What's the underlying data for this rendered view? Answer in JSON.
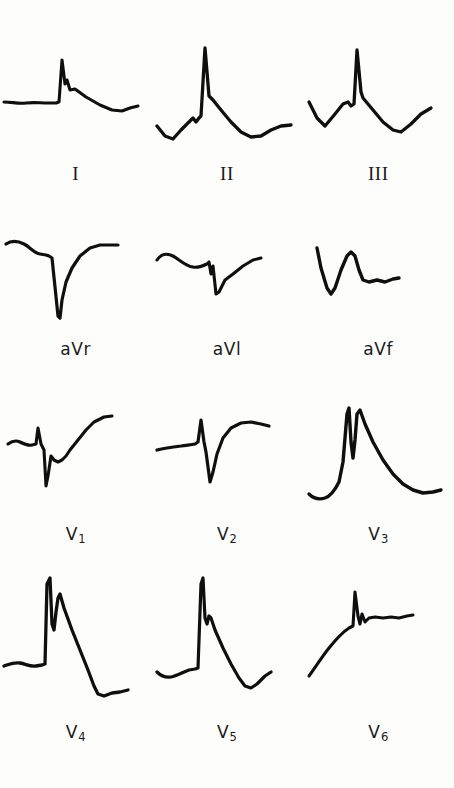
{
  "figure": {
    "kind": "12-lead-electrocardiogram",
    "background_color": "#fdfdfc",
    "trace_color": "#100f0f",
    "rows": 4,
    "columns": 3
  },
  "rows": [
    {
      "name": "limb-leads",
      "leads": [
        {
          "id": "I",
          "label": "I",
          "label_style": "roman",
          "morphology": "flat isoelectric baseline, small sharp R wave with notch on downstroke, low rounded T wave descending to end",
          "r_wave_height": "small",
          "s_wave_depth": "none",
          "t_wave": "low positive",
          "path": "M4,62 C12,62 18,64 26,63 C34,62 40,63 48,63 L56,63 L59,62 L62,20 L65,44 L67,40 L70,50 L75,49 L86,57 L100,65 L112,70 L122,71 L130,68 L138,66"
        },
        {
          "id": "II",
          "label": "II",
          "label_style": "roman",
          "morphology": "initial downward dip, small bump, very tall narrow R wave, rapid descent with shoulder, T wave trough then rise",
          "r_wave_height": "very tall",
          "s_wave_depth": "none",
          "t_wave": "inverted then rising",
          "path": "M6,86 L14,96 L22,99 L30,90 L38,82 L42,78 L45,82 L48,78 L50,76 L54,8 L58,56 L62,60 L70,70 L80,82 L90,92 L100,97 L110,96 L120,90 L130,86 L140,85"
        },
        {
          "id": "III",
          "label": "III",
          "label_style": "roman",
          "morphology": "initial dip, rounded bump, tall narrow R wave, steep descent to deep trough, then rise at end",
          "r_wave_height": "tall",
          "s_wave_depth": "none",
          "t_wave": "inverted trough then rising",
          "path": "M6,62 L14,78 L22,86 L32,74 L40,64 L45,62 L48,66 L51,64 L54,10 L58,52 L60,58 L70,70 L80,82 L90,90 L98,92 L108,84 L118,74 L128,68"
        }
      ]
    },
    {
      "name": "augmented-leads",
      "leads": [
        {
          "id": "aVr",
          "label": "aVr",
          "label_style": "av",
          "morphology": "flat upper baseline with small bump, steep deep QS complex, slow curved recovery with shoulder",
          "r_wave_height": "none",
          "s_wave_depth": "very deep",
          "t_wave": "none discernible",
          "path": "M6,22 C12,18 18,19 24,22 C30,25 34,31 40,32 L46,33 L49,34 L52,36 L58,94 L60,96 L62,78 L66,60 L72,46 L80,34 L90,26 L100,23 L110,23 L118,23"
        },
        {
          "id": "aVl",
          "label": "aVl",
          "label_style": "av",
          "morphology": "gently undulating baseline, small bump, narrow sharp negative deflection, rise with shoulder",
          "r_wave_height": "tiny",
          "s_wave_depth": "moderate",
          "t_wave": "low positive",
          "path": "M6,38 C10,32 16,31 22,34 C28,37 34,44 42,45 C48,46 52,44 56,42 L58,40 L60,52 L62,44 L65,72 L68,70 L74,58 L82,52 L92,44 L102,38 L110,36"
        },
        {
          "id": "aVf",
          "label": "aVf",
          "label_style": "av",
          "morphology": "starts high, sharp V-shaped dip, rises to rounded peak, drops to small step, then flat tail",
          "r_wave_height": "moderate rounded",
          "s_wave_depth": "deep initial Q",
          "t_wave": "flat",
          "path": "M14,26 L18,46 L24,66 L28,72 L32,66 L38,48 L44,34 L48,30 L52,34 L56,48 L60,58 L66,60 L74,58 L82,60 L90,57 L96,56"
        }
      ]
    },
    {
      "name": "precordial-leads-v1-v3",
      "leads": [
        {
          "id": "V1",
          "label": "V",
          "label_sub": "1",
          "label_style": "v",
          "morphology": "small baseline wave, tiny r spike, deep narrow S wave, notch/step, rising ST-T to elevated plateau",
          "r_wave_height": "tiny",
          "s_wave_depth": "deep",
          "t_wave": "rising positive plateau",
          "path": "M8,46 C12,43 16,42 20,44 C24,46 28,48 32,47 L36,46 L38,30 L41,46 L44,52 L46,88 L48,78 L51,58 L54,62 L58,64 L62,62 L66,58 L70,52 L78,42 L86,32 L94,24 L104,19 L112,18"
        },
        {
          "id": "V2",
          "label": "V",
          "label_sub": "2",
          "label_style": "v",
          "morphology": "flat baseline, sharp narrow r spike, deep narrow S wave, rapid rise to rounded elevated ST-T plateau",
          "r_wave_height": "small sharp",
          "s_wave_depth": "deep",
          "t_wave": "elevated rounded positive",
          "path": "M6,52 C14,50 22,49 30,48 C36,47 40,47 44,46 L47,44 L50,22 L53,44 L55,54 L59,84 L62,74 L66,56 L72,40 L80,30 L90,25 L100,24 L110,26 L118,28"
        },
        {
          "id": "V3",
          "label": "V",
          "label_sub": "3",
          "label_style": "v",
          "morphology": "low baseline, steep tall rise to spike, sharp V notch, second slightly taller peak, long convex downslope to trough then slight rise",
          "r_wave_height": "very tall notched",
          "s_wave_depth": "none",
          "t_wave": "broad merged with QRS, descending",
          "path": "M6,96 C10,100 16,102 22,100 C28,98 32,92 36,84 L40,64 L44,16 L46,10 L48,44 L50,60 L52,42 L54,16 L57,12 L62,26 L70,44 L80,62 L90,76 L100,86 L110,92 L120,95 L130,94 L138,92"
        }
      ]
    },
    {
      "name": "precordial-leads-v4-v6",
      "leads": [
        {
          "id": "V4",
          "label": "V",
          "label_sub": "4",
          "label_style": "v",
          "morphology": "flat low baseline, very tall narrow R wave, deep notch, second lower peak, long steep downslope to deep trough, then flat tail",
          "r_wave_height": "very tall notched",
          "s_wave_depth": "deep terminal",
          "t_wave": "inverted trough then flat",
          "path": "M4,94 C10,92 14,90 20,91 C26,92 30,95 36,94 L42,93 L45,92 L47,12 L50,6 L52,52 L54,58 L56,40 L58,26 L60,22 L64,36 L72,58 L80,78 L88,98 L94,114 L98,122 L104,124 L112,121 L120,120 L128,118"
        },
        {
          "id": "V5",
          "label": "V",
          "label_sub": "5",
          "label_style": "v",
          "morphology": "undulating baseline, tall narrow R wave, small notch on descent, long downslope to trough, then rise at end",
          "r_wave_height": "tall",
          "s_wave_depth": "moderate terminal",
          "t_wave": "inverted trough then rising",
          "path": "M6,100 C10,104 14,106 20,105 C26,104 32,100 38,98 L44,97 L47,96 L50,12 L52,6 L54,46 L56,52 L58,44 L60,46 L64,58 L72,76 L80,92 L88,106 L94,114 L100,116 L106,112 L114,104 L120,100"
        },
        {
          "id": "V6",
          "label": "V",
          "label_sub": "6",
          "label_style": "v",
          "morphology": "curved rising baseline from low left, sharp R spike, small S notch, nearly flat slightly descending tail",
          "r_wave_height": "moderate sharp",
          "s_wave_depth": "small",
          "t_wave": "flat low positive",
          "path": "M6,104 C12,96 18,86 26,76 C34,66 40,60 46,56 L50,54 L52,20 L55,44 L57,52 L59,42 L62,50 L66,46 L72,45 L80,46 L88,45 L96,46 L104,44 L110,43"
        }
      ]
    }
  ]
}
